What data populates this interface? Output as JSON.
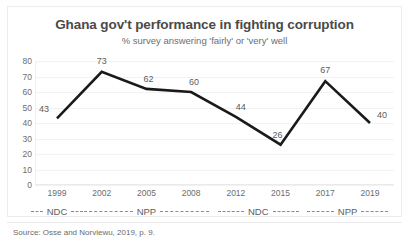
{
  "chart_data": {
    "type": "line",
    "title": "Ghana gov't performance in fighting corruption",
    "subtitle": "% survey answering 'fairly' or 'very' well",
    "xlabel": "",
    "ylabel": "",
    "categories": [
      "1999",
      "2002",
      "2005",
      "2008",
      "2012",
      "2015",
      "2017",
      "2019"
    ],
    "values": [
      43,
      73,
      62,
      60,
      44,
      26,
      67,
      40
    ],
    "point_labels": [
      "43",
      "73",
      "62",
      "60",
      "44",
      "26",
      "67",
      "40"
    ],
    "ylim": [
      0,
      80
    ],
    "ytick_labels": [
      "80",
      "70",
      "60",
      "50",
      "40",
      "30",
      "20",
      "10",
      "0"
    ],
    "ytick_values": [
      80,
      70,
      60,
      50,
      40,
      30,
      20,
      10,
      0
    ],
    "grid": true,
    "legend": "none",
    "series_color": "#1a1a1a",
    "grid_color": "#f2f2f2",
    "text_color": "#5c5c5c",
    "title_color": "#4a4a4a"
  },
  "periods": [
    {
      "label": "NDC",
      "start_year": "1999",
      "end_year": "1999"
    },
    {
      "label": "NPP",
      "start_year": "2002",
      "end_year": "2008"
    },
    {
      "label": "NDC",
      "start_year": "2012",
      "end_year": "2015"
    },
    {
      "label": "NPP",
      "start_year": "2017",
      "end_year": "2019"
    }
  ],
  "source": "Source: Osse and Norviewu, 2019, p. 9."
}
